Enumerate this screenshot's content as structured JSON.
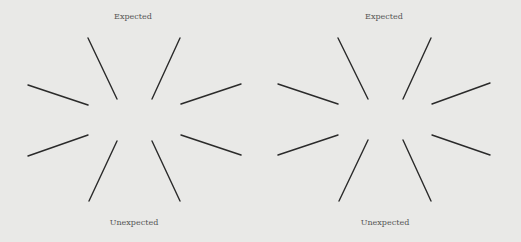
{
  "panels": [
    {
      "id": "left",
      "top_label": "Expected",
      "bottom_label": "Unexpected",
      "top_label_pos": [
        133,
        13
      ],
      "bottom_label_pos": [
        134,
        219
      ]
    },
    {
      "id": "right",
      "top_label": "Expected",
      "bottom_label": "Unexpected",
      "top_label_pos": [
        384,
        13
      ],
      "bottom_label_pos": [
        385,
        219
      ]
    }
  ],
  "style": {
    "background": "#e9e9e7",
    "line_color": "#2a2a2a",
    "label_color": "#555555"
  },
  "lines": {
    "left": [
      {
        "name": "upper-left-steep",
        "x1": 88,
        "y1": 38,
        "x2": 117,
        "y2": 99
      },
      {
        "name": "upper-right-steep",
        "x1": 180,
        "y1": 38,
        "x2": 152,
        "y2": 99
      },
      {
        "name": "upper-left-shallow",
        "x1": 28,
        "y1": 85,
        "x2": 88,
        "y2": 105
      },
      {
        "name": "upper-right-shallow",
        "x1": 241,
        "y1": 84,
        "x2": 181,
        "y2": 104
      },
      {
        "name": "lower-left-shallow",
        "x1": 88,
        "y1": 135,
        "x2": 28,
        "y2": 156
      },
      {
        "name": "lower-right-shallow",
        "x1": 181,
        "y1": 135,
        "x2": 241,
        "y2": 155
      },
      {
        "name": "lower-left-steep",
        "x1": 117,
        "y1": 141,
        "x2": 89,
        "y2": 201
      },
      {
        "name": "lower-right-steep",
        "x1": 152,
        "y1": 141,
        "x2": 180,
        "y2": 201
      }
    ],
    "right": [
      {
        "name": "upper-left-steep",
        "x1": 338,
        "y1": 38,
        "x2": 368,
        "y2": 99
      },
      {
        "name": "upper-right-steep",
        "x1": 431,
        "y1": 38,
        "x2": 403,
        "y2": 99
      },
      {
        "name": "upper-left-shallow",
        "x1": 278,
        "y1": 84,
        "x2": 338,
        "y2": 104
      },
      {
        "name": "upper-right-shallow",
        "x1": 490,
        "y1": 83,
        "x2": 432,
        "y2": 104
      },
      {
        "name": "lower-left-shallow",
        "x1": 338,
        "y1": 135,
        "x2": 278,
        "y2": 155
      },
      {
        "name": "lower-right-shallow",
        "x1": 432,
        "y1": 135,
        "x2": 490,
        "y2": 155
      },
      {
        "name": "lower-left-steep",
        "x1": 368,
        "y1": 140,
        "x2": 339,
        "y2": 201
      },
      {
        "name": "lower-right-steep",
        "x1": 403,
        "y1": 140,
        "x2": 431,
        "y2": 201
      }
    ]
  }
}
